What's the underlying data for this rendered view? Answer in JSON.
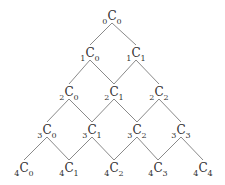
{
  "diagram": {
    "symbol": "C",
    "line_color": "#8a8a8a",
    "rows": [
      {
        "n": 0,
        "y": 16,
        "nodes": [
          {
            "n": "0",
            "k": "0",
            "x": 112
          }
        ]
      },
      {
        "n": 1,
        "y": 53,
        "nodes": [
          {
            "n": "1",
            "k": "0",
            "x": 90
          },
          {
            "n": "1",
            "k": "1",
            "x": 136
          }
        ]
      },
      {
        "n": 2,
        "y": 92,
        "nodes": [
          {
            "n": "2",
            "k": "0",
            "x": 69
          },
          {
            "n": "2",
            "k": "1",
            "x": 114
          },
          {
            "n": "2",
            "k": "2",
            "x": 159
          }
        ]
      },
      {
        "n": 3,
        "y": 130,
        "nodes": [
          {
            "n": "3",
            "k": "0",
            "x": 47
          },
          {
            "n": "3",
            "k": "1",
            "x": 92
          },
          {
            "n": "3",
            "k": "2",
            "x": 137
          },
          {
            "n": "3",
            "k": "3",
            "x": 181
          }
        ]
      },
      {
        "n": 4,
        "y": 168,
        "nodes": [
          {
            "n": "4",
            "k": "0",
            "x": 24
          },
          {
            "n": "4",
            "k": "1",
            "x": 69
          },
          {
            "n": "4",
            "k": "2",
            "x": 114
          },
          {
            "n": "4",
            "k": "3",
            "x": 158
          },
          {
            "n": "4",
            "k": "4",
            "x": 203
          }
        ]
      }
    ]
  }
}
